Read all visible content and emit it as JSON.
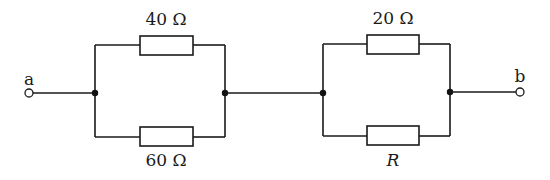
{
  "diagram": {
    "type": "circuit-schematic",
    "terminals": [
      {
        "id": "a",
        "label": "a"
      },
      {
        "id": "b",
        "label": "b"
      }
    ],
    "parallel_blocks": [
      {
        "id": "block-1",
        "top_resistor": {
          "label": "40 Ω",
          "value": 40,
          "unit": "Ω"
        },
        "bottom_resistor": {
          "label": "60 Ω",
          "value": 60,
          "unit": "Ω"
        }
      },
      {
        "id": "block-2",
        "top_resistor": {
          "label": "20 Ω",
          "value": 20,
          "unit": "Ω"
        },
        "bottom_resistor": {
          "label": "R",
          "value": null,
          "unit": ""
        }
      }
    ],
    "topology": "a — (40 Ω ∥ 60 Ω) — (20 Ω ∥ R) — b",
    "colors": {
      "line": "#1a1a1a",
      "background": "#ffffff"
    }
  }
}
